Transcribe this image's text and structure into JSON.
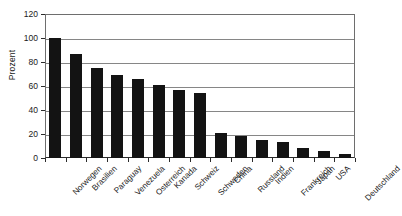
{
  "chart_data": {
    "type": "bar",
    "title": "",
    "subtitle": "",
    "xlabel": "",
    "ylabel": "Prozent",
    "ylim": [
      0,
      120
    ],
    "ytick_step": 20,
    "yticks": [
      0,
      20,
      40,
      60,
      80,
      100,
      120
    ],
    "grid": "horizontal",
    "legend": "none",
    "bar_color": "#131313",
    "categories": [
      "Norwegen",
      "Brasilien",
      "Paraguay",
      "Venezuela",
      "Osterreich",
      "Kanada",
      "Schweiz",
      "Schweden",
      "China",
      "Russland",
      "Indien",
      "Frankreich",
      "Japan",
      "USA",
      "Deutschland"
    ],
    "values": [
      100,
      87,
      75,
      69,
      66,
      61,
      57,
      54,
      21,
      18,
      15,
      13,
      8,
      6,
      3
    ]
  }
}
